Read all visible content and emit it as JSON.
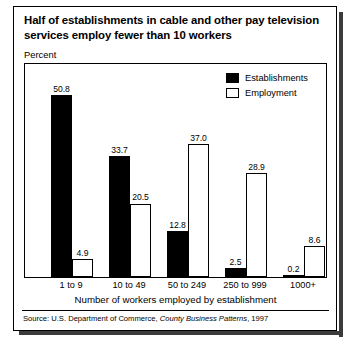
{
  "title": "Half of establishments in cable and other pay television services employ fewer than 10 workers",
  "axis_unit_label": "Percent",
  "source": {
    "prefix": "Source: U.S. Department of Commerce, ",
    "publication": "County Business Patterns",
    "suffix": ", 1997"
  },
  "chart_data": {
    "type": "bar",
    "title": "Half of establishments in cable and other pay television services employ fewer than 10 workers",
    "xlabel": "Number of workers employed by establishment",
    "ylabel": "Percent",
    "ylim": [
      0,
      55
    ],
    "grid": false,
    "legend_position": "top-right-inside",
    "categories": [
      "1 to 9",
      "10 to 49",
      "50 to 249",
      "250 to 999",
      "1000+"
    ],
    "series": [
      {
        "name": "Establishments",
        "color": "#000000",
        "style": "filled",
        "values": [
          50.8,
          33.7,
          12.8,
          2.5,
          0.2
        ]
      },
      {
        "name": "Employment",
        "color": "#ffffff",
        "style": "hollow",
        "values": [
          4.9,
          20.5,
          37.0,
          28.9,
          8.6
        ]
      }
    ]
  }
}
